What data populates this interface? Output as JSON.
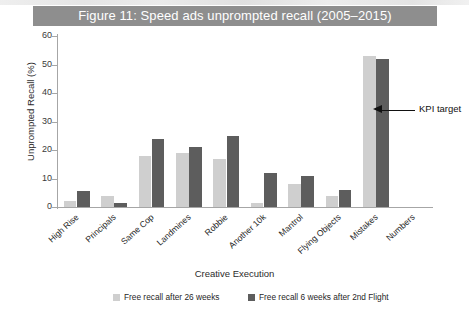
{
  "figure": {
    "title": "Figure 11: Speed ads unprompted recall (2005–2015)",
    "title_bg": "#8e8e8e",
    "title_color": "#ffffff"
  },
  "annotation": {
    "label": "KPI target",
    "icon": "left-arrow-icon",
    "value": 34
  },
  "chart_data": {
    "type": "bar",
    "title": "Figure 11: Speed ads unprompted recall (2005–2015)",
    "xlabel": "Creative Execution",
    "ylabel": "Unprompted Recall (%)",
    "ylim": [
      0,
      60
    ],
    "yticks": [
      0,
      10,
      20,
      30,
      40,
      50,
      60
    ],
    "grid": false,
    "legend_position": "bottom",
    "categories": [
      "High Rise",
      "Principals",
      "Same Cop",
      "Landmines",
      "Robbie",
      "Another 10k",
      "Mantrol",
      "Flying Objects",
      "Mistakes",
      "Numbers"
    ],
    "series": [
      {
        "name": "Free recall after 26 weeks",
        "color": "#cfcfcf",
        "values": [
          2,
          4,
          18,
          19,
          17,
          1.5,
          8,
          4,
          53,
          0
        ]
      },
      {
        "name": "Free recall 6 weeks after 2nd Flight",
        "color": "#5d5d5d",
        "values": [
          5.5,
          1.5,
          24,
          21,
          25,
          12,
          11,
          6,
          52,
          0
        ]
      }
    ],
    "annotations": [
      {
        "text": "KPI target",
        "target_series": "Free recall 6 weeks after 2nd Flight",
        "target_category": "Mistakes",
        "y": 34
      }
    ]
  }
}
